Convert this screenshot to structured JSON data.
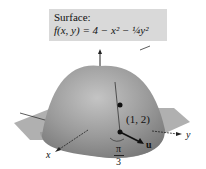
{
  "caption": {
    "title": "Surface:",
    "equation": "f(x, y) = 4 − x² − ¼y²"
  },
  "axes": {
    "x_label": "x",
    "y_label": "y",
    "z_label": "z"
  },
  "point_label": "(1, 2)",
  "vector_label": "u",
  "angle_label": {
    "numerator": "π",
    "denominator": "3"
  },
  "colors": {
    "surface": "#8e8e8e",
    "plane": "#a8a8a8",
    "caption_bg": "#d9d9d9"
  }
}
